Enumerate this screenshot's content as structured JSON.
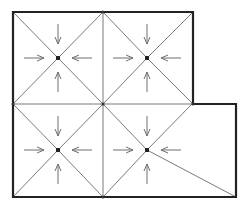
{
  "diagram": {
    "title": "",
    "colors": {
      "outline": "#222222",
      "inner_lines": "#7a7a7a",
      "arrows": "#6f6f6f",
      "center_dot": "#222222"
    },
    "outline_points": [
      [
        13,
        12
      ],
      [
        193,
        12
      ],
      [
        193,
        104
      ],
      [
        236,
        104
      ],
      [
        236,
        197
      ],
      [
        13,
        197
      ]
    ],
    "grid_lines": [
      [
        [
          103,
          12
        ],
        [
          103,
          197
        ]
      ],
      [
        [
          13,
          104
        ],
        [
          193,
          104
        ]
      ]
    ],
    "cells": [
      {
        "id": "top-left",
        "center": [
          58,
          58
        ],
        "corners": [
          [
            13,
            12
          ],
          [
            103,
            12
          ],
          [
            103,
            104
          ],
          [
            13,
            104
          ]
        ]
      },
      {
        "id": "top-right",
        "center": [
          147,
          58
        ],
        "corners": [
          [
            103,
            12
          ],
          [
            193,
            12
          ],
          [
            193,
            104
          ],
          [
            103,
            104
          ]
        ]
      },
      {
        "id": "bottom-left",
        "center": [
          58,
          150
        ],
        "corners": [
          [
            13,
            104
          ],
          [
            103,
            104
          ],
          [
            103,
            197
          ],
          [
            13,
            197
          ]
        ]
      },
      {
        "id": "bottom-right",
        "center": [
          147,
          150
        ],
        "corners": [
          [
            103,
            104
          ],
          [
            192,
            104
          ],
          [
            236,
            197
          ],
          [
            103,
            197
          ]
        ]
      }
    ],
    "arrow_style": "four inward arrows toward each cell center (from top, bottom, left, right)"
  }
}
